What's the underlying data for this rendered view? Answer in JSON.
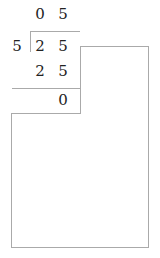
{
  "division": {
    "quotient": [
      "0",
      "5"
    ],
    "divisor": "5",
    "dividend": [
      "2",
      "5"
    ],
    "subtrahend": [
      "2",
      "5"
    ],
    "remainder": "0"
  },
  "colors": {
    "line": "#aaaaaa",
    "text": "#222222"
  }
}
